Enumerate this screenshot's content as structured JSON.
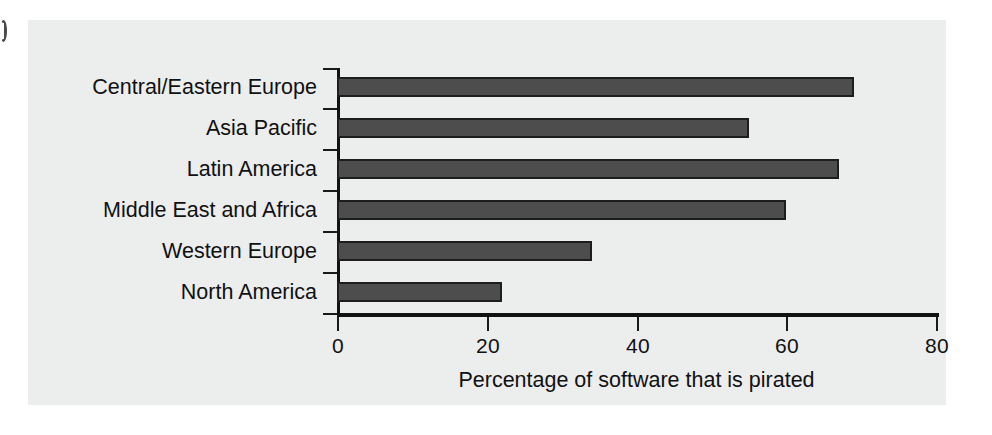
{
  "figure": {
    "panel_background": "#eceded",
    "page_background": "#ffffff",
    "edge_mark_name": "cropped-figure-marker"
  },
  "chart_data": {
    "type": "bar",
    "orientation": "horizontal",
    "title": "",
    "subtitle": "",
    "xlabel": "Percentage of software that is pirated",
    "ylabel": "",
    "categories": [
      "Central/Eastern Europe",
      "Asia Pacific",
      "Latin America",
      "Middle East and Africa",
      "Western Europe",
      "North America"
    ],
    "values": [
      69,
      55,
      67,
      60,
      34,
      22
    ],
    "xlim": [
      0,
      80
    ],
    "ylim": null,
    "xticks": [
      0,
      20,
      40,
      60,
      80
    ],
    "xtick_labels": [
      "0",
      "20",
      "40",
      "60",
      "80"
    ],
    "grid": false,
    "legend": null,
    "bar_color": "#4d4d4d",
    "bar_edge_color": "#1d1d1d",
    "axis_color": "#111111",
    "annotations": []
  }
}
